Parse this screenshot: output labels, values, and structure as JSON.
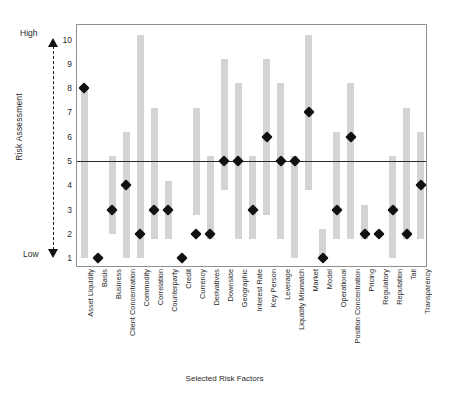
{
  "axes": {
    "ylabel": "Risk Assessment",
    "xlabel": "Selected Risk Factors",
    "y_high_label": "High",
    "y_low_label": "Low",
    "yticks": [
      1,
      2,
      3,
      4,
      5,
      6,
      7,
      8,
      9,
      10
    ]
  },
  "colors": {
    "bar": "#d4d4d4",
    "marker": "#111111",
    "refline": "#2a2a2a",
    "frame": "#8f8f8f"
  },
  "chart_data": {
    "type": "bar",
    "title": "",
    "xlabel": "Selected Risk Factors",
    "ylabel": "Risk Assessment",
    "ylim": [
      0.6,
      10.6
    ],
    "grid": false,
    "legend": "none",
    "reference_line": 5,
    "annotations": [
      "High",
      "Low"
    ],
    "categories": [
      "Asset Liquidity",
      "Basis",
      "Business",
      "Client Concentration",
      "Commodity",
      "Correlation",
      "Counterparty",
      "Credit",
      "Currency",
      "Derivatives",
      "Downside",
      "Geographic",
      "Interest Rate",
      "Key Person",
      "Leverage",
      "Liquidity Mismatch",
      "Market",
      "Model",
      "Operational",
      "Position Concentration",
      "Pricing",
      "Regulatory",
      "Reputation",
      "Tail",
      "Transparency"
    ],
    "series": [
      {
        "name": "Range",
        "type": "range-bar",
        "low": [
          1,
          null,
          2,
          1,
          1,
          1.8,
          1.8,
          null,
          2.8,
          1.8,
          3.8,
          1.8,
          1.8,
          2.8,
          1.8,
          1,
          3.8,
          1,
          1.8,
          1.8,
          1.8,
          null,
          1,
          1.8,
          1.8
        ],
        "high": [
          8,
          null,
          5.2,
          6.2,
          10.2,
          7.2,
          4.2,
          null,
          7.2,
          5.2,
          9.2,
          8.2,
          5.2,
          9.2,
          8.2,
          5.2,
          10.2,
          2.2,
          6.2,
          8.2,
          3.2,
          null,
          5.2,
          7.2,
          6.2
        ]
      },
      {
        "name": "Assessment",
        "type": "marker",
        "values": [
          8,
          1,
          3,
          4,
          2,
          3,
          3,
          1,
          2,
          2,
          5,
          5,
          3,
          6,
          5,
          5,
          7,
          1,
          3,
          6,
          2,
          2,
          3,
          2,
          4
        ]
      }
    ]
  }
}
